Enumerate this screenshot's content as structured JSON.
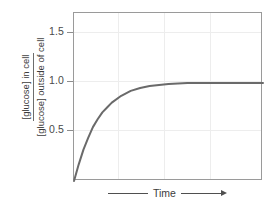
{
  "chart_data": {
    "type": "line",
    "title": "",
    "subtitle": "",
    "xlabel": "Time",
    "ylabel": "[glucose] in cell / [glucose] outside of cell",
    "ylabel_numerator": "[glucose] in cell",
    "ylabel_denominator": "[glucose] outside of cell",
    "ylim": [
      0.0,
      1.715
    ],
    "xlim": [
      0,
      10
    ],
    "ytick_labels": [
      "1.5",
      "1.0",
      "0.5"
    ],
    "ytick_values": [
      1.5,
      1.0,
      0.5
    ],
    "xtick_labels": [],
    "grid": true,
    "grid_color": "#ededed",
    "legend": "none",
    "series": [
      {
        "name": "glucose equilibration",
        "color": "#6a6a6a",
        "line_width": 2,
        "description": "saturating exponential approach to equilibrium at 1.0",
        "x": [
          0.0,
          0.25,
          0.5,
          0.75,
          1.0,
          1.25,
          1.5,
          1.75,
          2.0,
          2.5,
          3.0,
          3.5,
          4.0,
          4.5,
          5.0,
          5.5,
          6.0,
          7.0,
          8.0,
          9.0,
          10.0
        ],
        "y": [
          0.0,
          0.17,
          0.32,
          0.44,
          0.55,
          0.63,
          0.7,
          0.75,
          0.8,
          0.87,
          0.92,
          0.95,
          0.97,
          0.98,
          0.99,
          0.995,
          1.0,
          1.0,
          1.0,
          1.0,
          1.0
        ]
      }
    ],
    "annotations": [
      {
        "text": "Time",
        "position": "below-x-axis",
        "has_arrow": true
      }
    ]
  },
  "axis": {
    "frame_color": "#9a9a9a",
    "tick_color": "#8d8d8d",
    "label_color": "#3c3c3c"
  },
  "yticks": [
    {
      "label": "1.5",
      "value": 1.5
    },
    {
      "label": "1.0",
      "value": 1.0
    },
    {
      "label": "0.5",
      "value": 0.5
    }
  ],
  "xaxis": {
    "label": "Time"
  }
}
